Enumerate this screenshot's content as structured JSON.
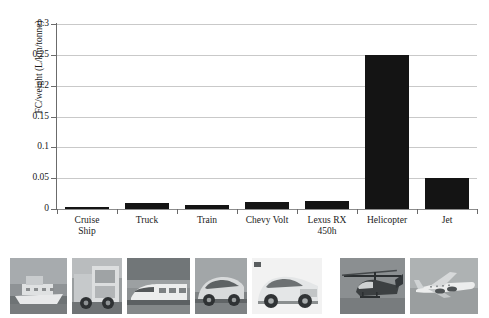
{
  "chart_data": {
    "type": "bar",
    "title": "",
    "xlabel": "",
    "ylabel": "FC/weight (L/km/tonne)",
    "ylim": [
      0,
      0.3
    ],
    "yticks": [
      "0",
      "0.05",
      "0.1",
      "0.15",
      "0.2",
      "0.25",
      "0.3"
    ],
    "ytick_values": [
      0,
      0.05,
      0.1,
      0.15,
      0.2,
      0.25,
      0.3
    ],
    "grid": "horizontal",
    "legend": "none",
    "bar_color": "#141414",
    "categories": [
      "Cruise Ship",
      "Truck",
      "Train",
      "Chevy Volt",
      "Lexus RX 450h",
      "Helicopter",
      "Jet"
    ],
    "category_lines": [
      [
        "Cruise",
        "Ship"
      ],
      [
        "Truck"
      ],
      [
        "Train"
      ],
      [
        "Chevy Volt"
      ],
      [
        "Lexus RX",
        "450h"
      ],
      [
        "Helicopter"
      ],
      [
        "Jet"
      ]
    ],
    "values": [
      0.003,
      0.01,
      0.007,
      0.011,
      0.013,
      0.25,
      0.05
    ]
  },
  "photo_strip": {
    "items": [
      {
        "name": "cruise-ship-photo",
        "caption": "Cruise Ship"
      },
      {
        "name": "truck-photo",
        "caption": "Truck"
      },
      {
        "name": "train-photo",
        "caption": "Train"
      },
      {
        "name": "chevy-volt-photo",
        "caption": "Chevy Volt"
      },
      {
        "name": "lexus-rx-450h-photo",
        "caption": "Lexus RX 450h"
      },
      {
        "name": "helicopter-photo",
        "caption": "Helicopter"
      },
      {
        "name": "jet-photo",
        "caption": "Jet"
      }
    ]
  }
}
